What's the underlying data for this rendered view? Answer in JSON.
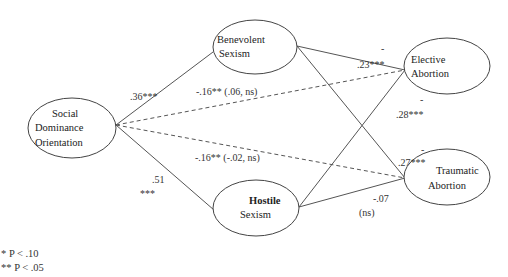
{
  "diagram": {
    "type": "path-model",
    "nodes": [
      {
        "id": "sdo",
        "lines": [
          "Social",
          "Dominance",
          "Orientation"
        ]
      },
      {
        "id": "benevolent",
        "lines": [
          "Benevolent",
          "Sexism"
        ]
      },
      {
        "id": "hostile",
        "lines": [
          "Hostile",
          "Sexism"
        ]
      },
      {
        "id": "elective",
        "lines": [
          "Elective",
          "Abortion"
        ]
      },
      {
        "id": "traumatic",
        "lines": [
          "Traumatic",
          "Abortion"
        ]
      }
    ],
    "edges": [
      {
        "from": "sdo",
        "to": "benevolent",
        "style": "solid",
        "label": ".36***"
      },
      {
        "from": "sdo",
        "to": "hostile",
        "style": "solid",
        "label": ".51",
        "label2": "***"
      },
      {
        "from": "sdo",
        "to": "elective",
        "style": "dashed",
        "label": "-.16** (.06, ns)"
      },
      {
        "from": "sdo",
        "to": "traumatic",
        "style": "dashed",
        "label": "-.16** (-.02, ns)"
      },
      {
        "from": "benevolent",
        "to": "elective",
        "style": "solid",
        "label": ".23***",
        "sign": "-"
      },
      {
        "from": "benevolent",
        "to": "traumatic",
        "style": "solid",
        "label": ".27***",
        "sign": "-"
      },
      {
        "from": "hostile",
        "to": "elective",
        "style": "solid",
        "label": ".28***",
        "sign": "-"
      },
      {
        "from": "hostile",
        "to": "traumatic",
        "style": "solid",
        "label": "-.07",
        "label2": "(ns)"
      }
    ]
  },
  "legend": {
    "items": [
      "* P < .10",
      "** P < .05"
    ]
  }
}
